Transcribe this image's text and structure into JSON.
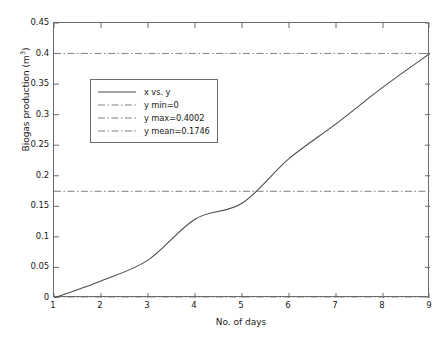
{
  "chart_data": {
    "type": "line",
    "title": "",
    "xlabel": "No. of days",
    "ylabel": "Biogas production (m3)",
    "ylabel_base": "Biogas production (m",
    "ylabel_sup": "3",
    "ylabel_tail": ")",
    "x": [
      1,
      2,
      3,
      4,
      5,
      6,
      7,
      8,
      9
    ],
    "values": [
      0,
      0.028,
      0.062,
      0.129,
      0.155,
      0.228,
      0.285,
      0.345,
      0.4002
    ],
    "series": [
      {
        "name": "x vs. y",
        "values": [
          0,
          0.028,
          0.062,
          0.129,
          0.155,
          0.228,
          0.285,
          0.345,
          0.4002
        ]
      }
    ],
    "xlim": [
      1,
      9
    ],
    "ylim": [
      0,
      0.45
    ],
    "xticks": [
      1,
      2,
      3,
      4,
      5,
      6,
      7,
      8,
      9
    ],
    "xtick_labels": [
      "1",
      "2",
      "3",
      "4",
      "5",
      "6",
      "7",
      "8",
      "9"
    ],
    "yticks": [
      0,
      0.05,
      0.1,
      0.15,
      0.2,
      0.25,
      0.3,
      0.35,
      0.4,
      0.45
    ],
    "ytick_labels": [
      "0",
      "0.05",
      "0.1",
      "0.15",
      "0.2",
      "0.25",
      "0.3",
      "0.35",
      "0.4",
      "0.45"
    ],
    "grid": false,
    "legend_position": "upper-left-inset",
    "reference_lines": [
      {
        "name": "y min",
        "label": "y min=0",
        "value": 0
      },
      {
        "name": "y max",
        "label": "y max=0.4002",
        "value": 0.4002
      },
      {
        "name": "y mean",
        "label": "y mean=0.1746",
        "value": 0.1746
      }
    ],
    "annotations": []
  },
  "legend": {
    "entries": [
      {
        "label": "x vs. y",
        "style": "solid"
      },
      {
        "label": "y min=0",
        "style": "dashdot"
      },
      {
        "label": "y max=0.4002",
        "style": "dashdot"
      },
      {
        "label": "y mean=0.1746",
        "style": "dashdot"
      }
    ]
  },
  "colors": {
    "line": "#4d4d4d",
    "reference_line": "#808080",
    "axis": "#6b6b6b",
    "text": "#1a1a1a",
    "background": "#ffffff"
  }
}
